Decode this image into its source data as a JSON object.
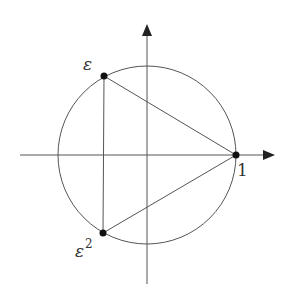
{
  "diagram": {
    "type": "unit-circle-roots-of-unity",
    "colors": {
      "stroke": "#555555",
      "point": "#111111",
      "text": "#333333",
      "background": "#ffffff"
    },
    "center": {
      "x": 147,
      "y": 155
    },
    "radius": 89,
    "axes": {
      "horizontal": {
        "x1": 20,
        "x2": 262,
        "arrow_tip_x": 275,
        "y": 155
      },
      "vertical": {
        "y1": 284,
        "y2": 38,
        "arrow_tip_y": 24,
        "x": 147
      }
    },
    "points": [
      {
        "id": "one",
        "label": "1",
        "x": 236,
        "y": 155,
        "label_x": 237,
        "label_y": 175
      },
      {
        "id": "epsilon",
        "label": "ε",
        "x": 104,
        "y": 76,
        "label_x": 83,
        "label_y": 69
      },
      {
        "id": "epsilon-squared",
        "label": "ε",
        "superscript": "2",
        "x": 103,
        "y": 233,
        "label_x": 75,
        "label_y": 256
      }
    ],
    "labels": {
      "one": "1",
      "epsilon": "ε",
      "epsilon_squared_base": "ε",
      "epsilon_squared_exp": "2"
    }
  }
}
